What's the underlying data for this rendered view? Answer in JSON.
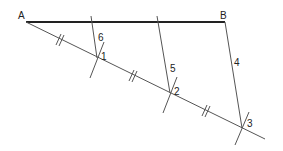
{
  "diagram": {
    "points": {
      "A": {
        "label": "A",
        "x": 26,
        "y": 22
      },
      "B": {
        "label": "B",
        "x": 225,
        "y": 22
      }
    },
    "divisions": [
      {
        "label": "1",
        "x": 97,
        "y": 58
      },
      {
        "label": "2",
        "x": 170,
        "y": 93
      },
      {
        "label": "3",
        "x": 242,
        "y": 128
      }
    ],
    "construction_lines": [
      {
        "label": "6"
      },
      {
        "label": "5"
      },
      {
        "label": "4"
      }
    ],
    "colors": {
      "main_segment": "#222222",
      "construction": "#555555",
      "background": "#ffffff"
    }
  }
}
